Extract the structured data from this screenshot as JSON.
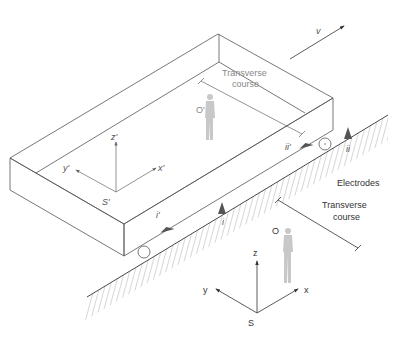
{
  "figure": {
    "velocity_label": "v",
    "moving_frame": {
      "observer_label": "O'",
      "origin_label": "S'",
      "axes": {
        "x": "x'",
        "y": "y'",
        "z": "z'"
      },
      "transverse_course_line1": "Transverse",
      "transverse_course_line2": "course",
      "electrode_labels": {
        "first": "i'",
        "second": "ii'"
      }
    },
    "ground_frame": {
      "observer_label": "O",
      "origin_label": "S",
      "axes": {
        "x": "x",
        "y": "y",
        "z": "z"
      },
      "transverse_course_line1": "Transverse",
      "transverse_course_line2": "course",
      "electrodes_label": "Electrodes",
      "electrode_labels": {
        "first": "i",
        "second": "ii"
      }
    },
    "colors": {
      "line": "#555555",
      "observer_figure": "#c8c8c8",
      "electrode_marker": "#555555",
      "background": "#ffffff"
    }
  }
}
